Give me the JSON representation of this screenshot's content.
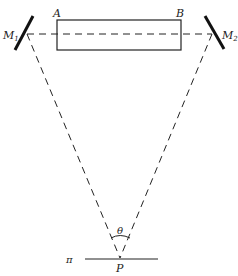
{
  "diagram": {
    "labels": {
      "A": "A",
      "B": "B",
      "M1": "M",
      "M1_sub": "1",
      "M2": "M",
      "M2_sub": "2",
      "theta": "θ",
      "P": "P",
      "pi": "π"
    },
    "elements": {
      "tube": "rectangle AB",
      "mirror_left": "M1",
      "mirror_right": "M2",
      "observation_point": "P",
      "plane": "π"
    },
    "colors": {
      "stroke": "#222222",
      "background": "#ffffff"
    }
  }
}
